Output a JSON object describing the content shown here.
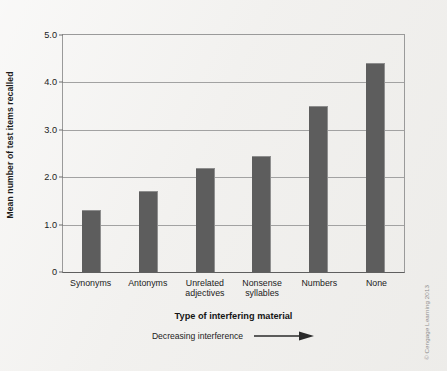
{
  "chart_data": {
    "type": "bar",
    "title": "",
    "categories": [
      "Synonyms",
      "Antonyms",
      "Unrelated adjectives",
      "Nonsense syllables",
      "Numbers",
      "None"
    ],
    "category_lines": [
      [
        "Synonyms"
      ],
      [
        "Antonyms"
      ],
      [
        "Unrelated",
        "adjectives"
      ],
      [
        "Nonsense",
        "syllables"
      ],
      [
        "Numbers"
      ],
      [
        "None"
      ]
    ],
    "values": [
      1.3,
      1.7,
      2.2,
      2.45,
      3.5,
      4.4
    ],
    "xlabel": "Type of interfering material",
    "ylabel": "Mean number of test items recalled",
    "ylim": [
      0,
      5.0
    ],
    "yticks": [
      0,
      1.0,
      2.0,
      3.0,
      4.0,
      5.0
    ],
    "ytick_labels": [
      "0",
      "1.0",
      "2.0",
      "3.0",
      "4.0",
      "5.0"
    ],
    "grid": true,
    "legend": "none",
    "bar_color": "#5d5d5d",
    "background_color": "#f2f1ef",
    "annotation": "Decreasing interference"
  },
  "credit": "© Cengage Learning 2013",
  "icons": {
    "arrow": "rightwards-arrow"
  }
}
